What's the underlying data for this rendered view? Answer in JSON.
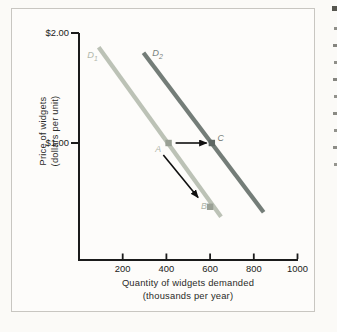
{
  "figure": {
    "page_background": "#fbfaf7",
    "border_color": "#c8c6c1",
    "background": "#fdfcfa"
  },
  "chart_data": {
    "type": "line",
    "title": "",
    "xlabel_line1": "Quantity of widgets demanded",
    "xlabel_line2": "(thousands per year)",
    "ylabel_line1": "Price of widgets",
    "ylabel_line2": "(dollars per unit)",
    "xlim": [
      0,
      1020
    ],
    "ylim": [
      0,
      2.06
    ],
    "grid": false,
    "legend": "none",
    "axis_color": "#1b1b1b",
    "arrow_color": "#101010",
    "x_ticks": [
      {
        "value": 200,
        "label": "200"
      },
      {
        "value": 400,
        "label": "400"
      },
      {
        "value": 600,
        "label": "600"
      },
      {
        "value": 800,
        "label": "800"
      },
      {
        "value": 1000,
        "label": "1000"
      }
    ],
    "y_ticks": [
      {
        "value": 1.0,
        "label": "$1.00"
      },
      {
        "value": 2.0,
        "label": "$2.00"
      }
    ],
    "series": [
      {
        "name": "D1",
        "letter": "D",
        "sub": "1",
        "color": "#bcc2b6",
        "label_color": "#b2b8ac",
        "x": [
          90,
          650
        ],
        "y": [
          1.87,
          0.33
        ],
        "label_at": [
          38,
          1.77
        ]
      },
      {
        "name": "D2",
        "letter": "D",
        "sub": "2",
        "color": "#747d78",
        "label_color": "#7a827d",
        "x": [
          295,
          845
        ],
        "y": [
          1.82,
          0.37
        ],
        "label_at": [
          335,
          1.79
        ]
      }
    ],
    "points": [
      {
        "name": "A",
        "label": "A",
        "x": 410,
        "y": 1.0,
        "dot_color": "#99a094",
        "label_color": "#aeb4a8",
        "label_at": [
          362,
          0.92
        ]
      },
      {
        "name": "B",
        "label": "B",
        "x": 600,
        "y": 0.42,
        "dot_color": "#9aa095",
        "label_color": "#aeb4a8",
        "label_at": [
          572,
          0.4
        ]
      },
      {
        "name": "C",
        "label": "C",
        "x": 608,
        "y": 1.0,
        "dot_color": "#5f6864",
        "label_color": "#757d78",
        "label_at": [
          648,
          1.02
        ]
      }
    ],
    "arrows": [
      {
        "name": "demand-shift-arrow",
        "from_x": 442,
        "from_y": 1.0,
        "to_x": 584,
        "to_y": 1.0
      },
      {
        "name": "movement-along-curve-arrow",
        "from_x": 386,
        "from_y": 0.89,
        "to_x": 545,
        "to_y": 0.505
      }
    ]
  },
  "edge_fragments": [
    {
      "y": 6,
      "h": 5,
      "w": 5,
      "c": "#56564f"
    },
    {
      "y": 27,
      "h": 3,
      "w": 3,
      "c": "#8f8f89"
    },
    {
      "y": 44,
      "h": 3,
      "w": 4,
      "c": "#85857f"
    },
    {
      "y": 61,
      "h": 3,
      "w": 3,
      "c": "#8f8f89"
    },
    {
      "y": 78,
      "h": 3,
      "w": 4,
      "c": "#85857f"
    },
    {
      "y": 95,
      "h": 3,
      "w": 3,
      "c": "#92928c"
    },
    {
      "y": 112,
      "h": 3,
      "w": 4,
      "c": "#8a8a84"
    },
    {
      "y": 129,
      "h": 3,
      "w": 3,
      "c": "#92928c"
    },
    {
      "y": 146,
      "h": 3,
      "w": 4,
      "c": "#8d8d87"
    },
    {
      "y": 163,
      "h": 3,
      "w": 3,
      "c": "#95958f"
    }
  ]
}
